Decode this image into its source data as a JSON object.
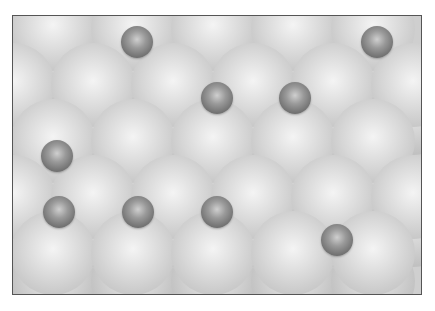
{
  "figure": {
    "frame": {
      "left": 12,
      "top": 15,
      "width": 410,
      "height": 280,
      "border_color": "#555555"
    },
    "colors": {
      "substrate": "#d9d9d9",
      "adatom": "#7a7a7a",
      "background": "#ffffff"
    },
    "substrate_lower_layer": [
      {
        "x": 40,
        "y": 41
      },
      {
        "x": 120,
        "y": 41
      },
      {
        "x": 200,
        "y": 41
      },
      {
        "x": 280,
        "y": 41
      },
      {
        "x": 360,
        "y": 41
      },
      {
        "x": 0,
        "y": 97
      },
      {
        "x": 80,
        "y": 97
      },
      {
        "x": 160,
        "y": 97
      },
      {
        "x": 240,
        "y": 97
      },
      {
        "x": 320,
        "y": 97
      },
      {
        "x": 400,
        "y": 97
      },
      {
        "x": 40,
        "y": 153
      },
      {
        "x": 120,
        "y": 153
      },
      {
        "x": 200,
        "y": 153
      },
      {
        "x": 280,
        "y": 153
      },
      {
        "x": 360,
        "y": 153
      },
      {
        "x": 0,
        "y": 209
      },
      {
        "x": 80,
        "y": 209
      },
      {
        "x": 160,
        "y": 209
      },
      {
        "x": 240,
        "y": 209
      },
      {
        "x": 320,
        "y": 209
      },
      {
        "x": 400,
        "y": 209
      },
      {
        "x": 40,
        "y": 265
      },
      {
        "x": 120,
        "y": 265
      },
      {
        "x": 200,
        "y": 265
      },
      {
        "x": 280,
        "y": 265
      },
      {
        "x": 360,
        "y": 265
      }
    ],
    "substrate_upper_layer": [
      {
        "x": 40,
        "y": 13
      },
      {
        "x": 120,
        "y": 13
      },
      {
        "x": 200,
        "y": 13
      },
      {
        "x": 280,
        "y": 13
      },
      {
        "x": 360,
        "y": 13
      },
      {
        "x": 0,
        "y": 69
      },
      {
        "x": 80,
        "y": 69
      },
      {
        "x": 160,
        "y": 69
      },
      {
        "x": 240,
        "y": 69
      },
      {
        "x": 320,
        "y": 69
      },
      {
        "x": 400,
        "y": 69
      },
      {
        "x": 40,
        "y": 125
      },
      {
        "x": 120,
        "y": 125
      },
      {
        "x": 200,
        "y": 125
      },
      {
        "x": 280,
        "y": 125
      },
      {
        "x": 360,
        "y": 125
      },
      {
        "x": 0,
        "y": 181
      },
      {
        "x": 80,
        "y": 181
      },
      {
        "x": 160,
        "y": 181
      },
      {
        "x": 240,
        "y": 181
      },
      {
        "x": 320,
        "y": 181
      },
      {
        "x": 400,
        "y": 181
      },
      {
        "x": 40,
        "y": 237
      },
      {
        "x": 120,
        "y": 237
      },
      {
        "x": 200,
        "y": 237
      },
      {
        "x": 280,
        "y": 237
      },
      {
        "x": 360,
        "y": 237
      }
    ],
    "adatoms": [
      {
        "x": 124,
        "y": 26
      },
      {
        "x": 364,
        "y": 26
      },
      {
        "x": 204,
        "y": 82
      },
      {
        "x": 282,
        "y": 82
      },
      {
        "x": 44,
        "y": 140
      },
      {
        "x": 46,
        "y": 196
      },
      {
        "x": 125,
        "y": 196
      },
      {
        "x": 204,
        "y": 196
      },
      {
        "x": 324,
        "y": 224
      }
    ]
  }
}
